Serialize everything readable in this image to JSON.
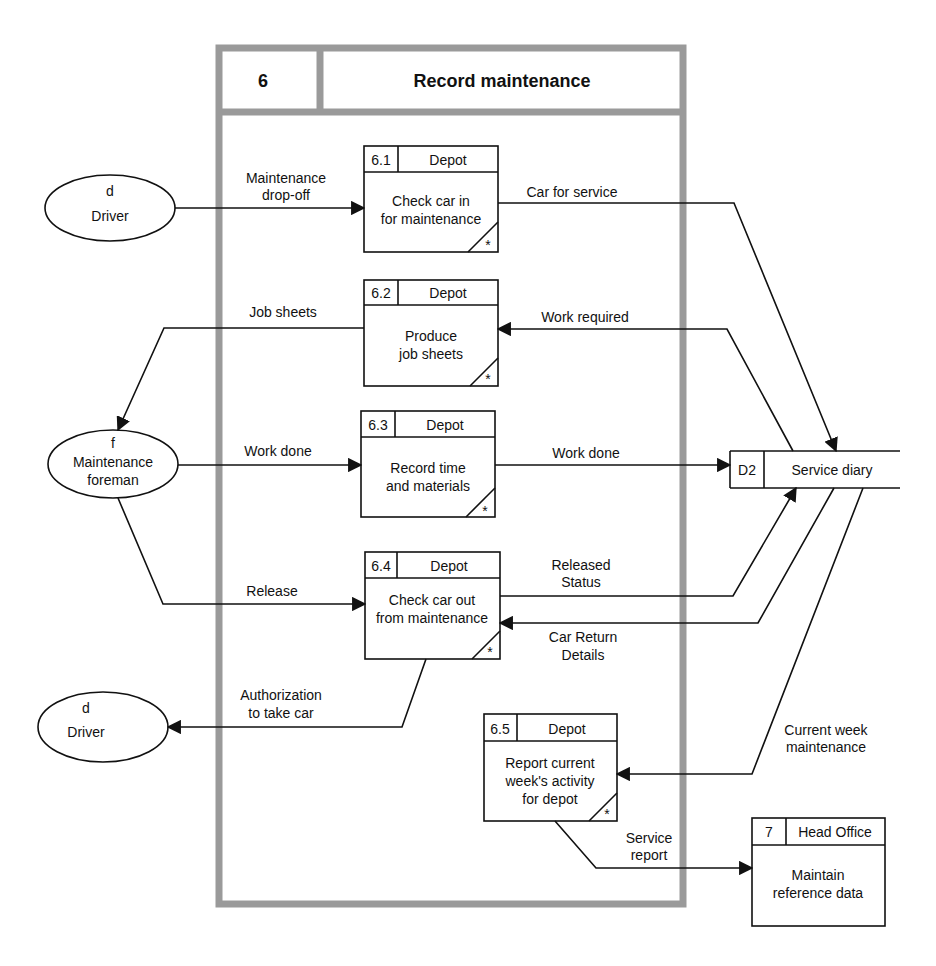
{
  "diagram": {
    "type": "data-flow-diagram",
    "frame": {
      "number": "6",
      "title": "Record maintenance"
    },
    "processes": [
      {
        "id": "6.1",
        "location": "Depot",
        "line1": "Check car  in",
        "line2": "for maintenance",
        "line3": "",
        "marker": "*"
      },
      {
        "id": "6.2",
        "location": "Depot",
        "line1": "Produce",
        "line2": "job sheets",
        "line3": "",
        "marker": "*"
      },
      {
        "id": "6.3",
        "location": "Depot",
        "line1": "Record  time",
        "line2": "and materials",
        "line3": "",
        "marker": "*"
      },
      {
        "id": "6.4",
        "location": "Depot",
        "line1": "Check car out",
        "line2": "from maintenance",
        "line3": "",
        "marker": "*"
      },
      {
        "id": "6.5",
        "location": "Depot",
        "line1": "Report current",
        "line2": "week's activity",
        "line3": "for depot",
        "marker": "*"
      },
      {
        "id": "7",
        "location": "Head Office",
        "line1": "Maintain",
        "line2": "reference data",
        "line3": ""
      }
    ],
    "externals": [
      {
        "code": "d",
        "name": "Driver"
      },
      {
        "code": "f",
        "name": "Maintenance",
        "name2": "foreman"
      },
      {
        "code": "d",
        "name": "Driver"
      }
    ],
    "datastore": {
      "id": "D2",
      "name": "Service diary"
    },
    "flows": [
      {
        "label1": "Maintenance",
        "label2": "drop-off",
        "from": "Driver",
        "to": "6.1"
      },
      {
        "label1": "Car for service",
        "from": "6.1",
        "to": "D2"
      },
      {
        "label1": "Work required",
        "from": "D2",
        "to": "6.2"
      },
      {
        "label1": "Job sheets",
        "from": "6.2",
        "to": "Maintenance foreman"
      },
      {
        "label1": "Work done",
        "from": "Maintenance foreman",
        "to": "6.3"
      },
      {
        "label1": "Work done",
        "from": "6.3",
        "to": "D2"
      },
      {
        "label1": "Release",
        "from": "Maintenance foreman",
        "to": "6.4"
      },
      {
        "label1": "Released",
        "label2": "Status",
        "from": "6.4",
        "to": "D2"
      },
      {
        "label1": "Car Return",
        "label2": "Details",
        "from": "D2",
        "to": "6.4"
      },
      {
        "label1": "Authorization",
        "label2": "to take car",
        "from": "6.4",
        "to": "Driver"
      },
      {
        "label1": "Current week",
        "label2": "maintenance",
        "from": "D2",
        "to": "6.5"
      },
      {
        "label1": "Service",
        "label2": "report",
        "from": "6.5",
        "to": "7"
      }
    ]
  }
}
